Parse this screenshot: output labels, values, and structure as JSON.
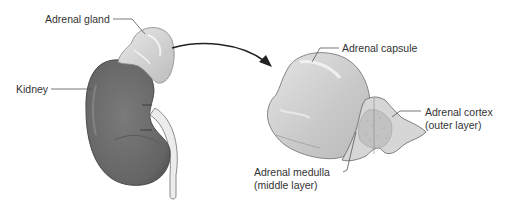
{
  "figure": {
    "labels": {
      "adrenal_gland": "Adrenal gland",
      "kidney": "Kidney",
      "adrenal_capsule": "Adrenal capsule",
      "adrenal_cortex_line1": "Adrenal cortex",
      "adrenal_cortex_line2": "(outer layer)",
      "adrenal_medulla_line1": "Adrenal medulla",
      "adrenal_medulla_line2": "(middle layer)"
    },
    "colors": {
      "kidney_fill": "#6e6e6e",
      "kidney_dark": "#555555",
      "gland_fill": "#d2d2d2",
      "section_fill": "#cfcfcf",
      "leader_line": "#555555",
      "arrow": "#222222"
    }
  }
}
